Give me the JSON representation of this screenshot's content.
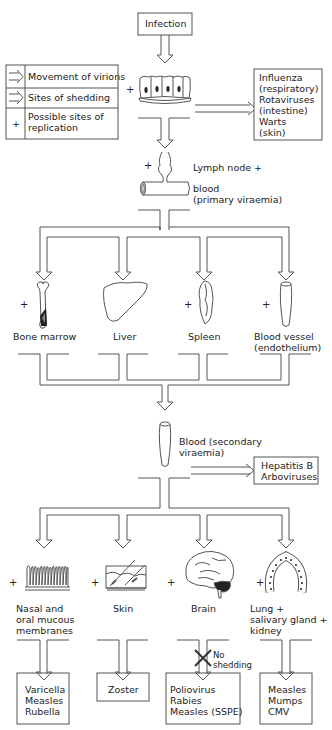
{
  "top": {
    "infection_label": "Infection"
  },
  "legend": {
    "rows": [
      {
        "symbol": "arrow-movement-icon",
        "label": "Movement of virions"
      },
      {
        "symbol": "arrow-shedding-icon",
        "label": "Sites of shedding"
      },
      {
        "symbol": "+",
        "label_line1": "Possible sites of",
        "label_line2": "replication"
      }
    ]
  },
  "epithelium": {
    "plus": "+"
  },
  "local_shedding_box": {
    "lines": [
      "Influenza",
      "(respiratory)",
      "Rotaviruses",
      "(intestine)",
      "Warts",
      "(skin)"
    ]
  },
  "lymph": {
    "plus": "+",
    "line1": "Lymph node +",
    "line2": "blood",
    "line3": "(primary viraemia)"
  },
  "primary_organs": [
    {
      "label": "Bone marrow",
      "plus": "+",
      "icon": "bone-icon"
    },
    {
      "label": "Liver",
      "plus": "",
      "icon": "liver-icon"
    },
    {
      "label": "Spleen",
      "plus": "+",
      "icon": "spleen-icon"
    },
    {
      "label": "Blood vessel",
      "label2": "(endothelium)",
      "plus": "+",
      "icon": "blood-vessel-icon"
    }
  ],
  "secondary_viraemia": {
    "line1": "Blood (secondary",
    "line2": "viraemia)"
  },
  "blood_shedding_box": {
    "lines": [
      "Hepatitis B",
      "Arboviruses"
    ]
  },
  "target_organs": [
    {
      "label_lines": [
        "Nasal and",
        "oral mucous",
        "membranes"
      ],
      "plus": "+",
      "icon": "mucous-membrane-icon",
      "viruses": [
        "Varicella",
        "Measles",
        "Rubella"
      ]
    },
    {
      "label_lines": [
        "Skin"
      ],
      "plus": "+",
      "icon": "skin-icon",
      "viruses": [
        "Zoster"
      ]
    },
    {
      "label_lines": [
        "Brain"
      ],
      "plus": "+",
      "icon": "brain-icon",
      "viruses": [
        "Poliovirus",
        "Rabies",
        "Measles (SSPE)"
      ],
      "note_line1": "No",
      "note_line2": "shedding"
    },
    {
      "label_lines": [
        "Lung +",
        "salivary gland +",
        "kidney"
      ],
      "plus": "+",
      "icon": "salivary-gland-icon",
      "viruses": [
        "Measles",
        "Mumps",
        "CMV"
      ]
    }
  ],
  "colors": {
    "line": "#555555",
    "text": "#222222",
    "dark_fill": "#222222"
  }
}
